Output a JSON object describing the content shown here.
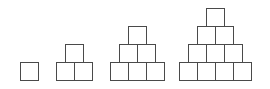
{
  "diagram": {
    "type": "block-staircase-pyramids",
    "stroke_color": "#4a4a4a",
    "fill_color": "#ffffff",
    "figures": [
      {
        "index": 1,
        "rows": [
          1
        ],
        "total_squares": 1
      },
      {
        "index": 2,
        "rows": [
          2,
          1
        ],
        "total_squares": 3
      },
      {
        "index": 3,
        "rows": [
          3,
          2,
          1
        ],
        "total_squares": 6
      },
      {
        "index": 4,
        "rows": [
          4,
          3,
          2,
          1
        ],
        "total_squares": 10
      }
    ],
    "layout": {
      "square_size": 18,
      "baseline_y": 80,
      "figure_left_x": [
        20,
        56,
        110,
        179
      ]
    }
  }
}
